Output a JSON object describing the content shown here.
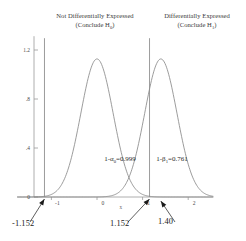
{
  "header": {
    "left": {
      "line1": "Not Differentially Expressed",
      "line2_pre": "(Conclude H",
      "line2_sub": "0",
      "line2_post": ")"
    },
    "right": {
      "line1": "Differentially Expressed",
      "line2_pre": "(Conclude H",
      "line2_sub": "1",
      "line2_post": ")"
    }
  },
  "chart_data": {
    "type": "line",
    "title": "",
    "xlabel": "x",
    "ylabel": "",
    "xlim": [
      -1.75,
      2.55
    ],
    "ylim": [
      0,
      1.28
    ],
    "grid": false,
    "legend": "none",
    "xticks": [
      "-1",
      "0",
      "1",
      "2"
    ],
    "xtick_values": [
      -1,
      0,
      1,
      2
    ],
    "yticks": [
      "0",
      ".4",
      ".8",
      "1.2"
    ],
    "ytick_values": [
      0,
      0.4,
      0.8,
      1.2
    ],
    "series": [
      {
        "name": "Null distribution",
        "type": "normal-density",
        "mean": 0,
        "sd": 0.354,
        "peak": 1.127
      },
      {
        "name": "Alternative distribution",
        "type": "normal-density",
        "mean": 1.4,
        "sd": 0.354,
        "peak": 1.127
      }
    ],
    "vlines": [
      {
        "name": "lower-critical-value",
        "x": -1.152
      },
      {
        "name": "upper-critical-value",
        "x": 1.152
      }
    ],
    "annotations": [
      {
        "name": "alpha-annotation",
        "text_pre": "1-α",
        "text_sub": "0",
        "text_post": "=0.999",
        "x": 0.16,
        "y": 0.3
      },
      {
        "name": "beta-annotation",
        "text_pre": "1-β",
        "text_sub": "1",
        "text_post": "=0.761",
        "x": 1.3,
        "y": 0.3
      }
    ],
    "callouts": [
      {
        "name": "callout-lower-critical",
        "label": "-1.152",
        "x": -1.152
      },
      {
        "name": "callout-upper-critical",
        "label": "1.152",
        "x": 1.152
      },
      {
        "name": "callout-alt-mean",
        "label": "1.40",
        "x": 1.4
      }
    ]
  },
  "colors": {
    "curve": "#8a8a8a",
    "axis": "#9a9a9a",
    "vline": "#8a8a8a",
    "text": "#2b2b2b",
    "callout": "#1a1a1a"
  }
}
